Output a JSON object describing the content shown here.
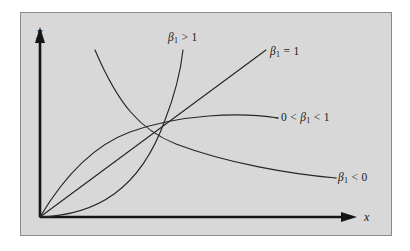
{
  "figure": {
    "background_color": "#ffffff",
    "panel_color": "#d8d8d8",
    "panel_border_color": "#8a8a8a",
    "curve_color": "#262626",
    "axis_color": "#151515"
  },
  "axes": {
    "y_label": "y",
    "x_label": "x",
    "y_arrow": "arrow-up-icon",
    "x_arrow": "arrow-right-icon"
  },
  "labels": {
    "beta_gt_1": {
      "beta": "β",
      "sub": "1",
      "relation": " > 1"
    },
    "beta_eq_1": {
      "beta": "β",
      "sub": "1",
      "relation": " = 1"
    },
    "beta_frac": {
      "prefix": "0 < ",
      "beta": "β",
      "sub": "1",
      "relation": " < 1"
    },
    "beta_neg": {
      "beta": "β",
      "sub": "1",
      "relation": " < 0"
    }
  },
  "chart_data": {
    "type": "line",
    "title": "",
    "xlabel": "x",
    "ylabel": "y",
    "grid": false,
    "legend": "inline-annotations",
    "xlim": [
      0,
      1
    ],
    "ylim": [
      0,
      1
    ],
    "series": [
      {
        "name": "β₁ > 1",
        "label": "β₁ > 1",
        "shape": "convex-increasing",
        "path": "M 40 217 C 96 215 140 190 165 120 C 176 92 181 68 183 50",
        "x": [
          0.0,
          0.2,
          0.4,
          0.55,
          0.7,
          0.8,
          0.88,
          0.95
        ],
        "y": [
          0.0,
          0.01,
          0.06,
          0.15,
          0.33,
          0.5,
          0.68,
          0.89
        ]
      },
      {
        "name": "β₁ = 1",
        "label": "β₁ = 1",
        "shape": "straight-line",
        "path": "M 40 217 L 266 50",
        "x": [
          0.0,
          0.25,
          0.5,
          0.75,
          1.0
        ],
        "y": [
          0.0,
          0.25,
          0.5,
          0.75,
          1.0
        ]
      },
      {
        "name": "0 < β₁ < 1",
        "label": "0 < β₁ < 1",
        "shape": "concave-increasing",
        "path": "M 40 217 C 62 180 92 146 130 132 C 180 114 240 112 278 118",
        "x": [
          0.0,
          0.1,
          0.25,
          0.45,
          0.65,
          0.85,
          1.0
        ],
        "y": [
          0.0,
          0.33,
          0.52,
          0.66,
          0.72,
          0.75,
          0.76
        ]
      },
      {
        "name": "β₁ < 0",
        "label": "β₁ < 0",
        "shape": "decreasing-decay",
        "path": "M 95 50 C 118 104 140 130 176 144 C 226 163 290 174 336 178",
        "x": [
          0.15,
          0.3,
          0.45,
          0.6,
          0.75,
          0.9,
          1.0
        ],
        "y": [
          0.92,
          0.56,
          0.4,
          0.28,
          0.2,
          0.16,
          0.14
        ]
      }
    ],
    "crossing_point": {
      "x": 0.61,
      "y": 0.58
    }
  }
}
